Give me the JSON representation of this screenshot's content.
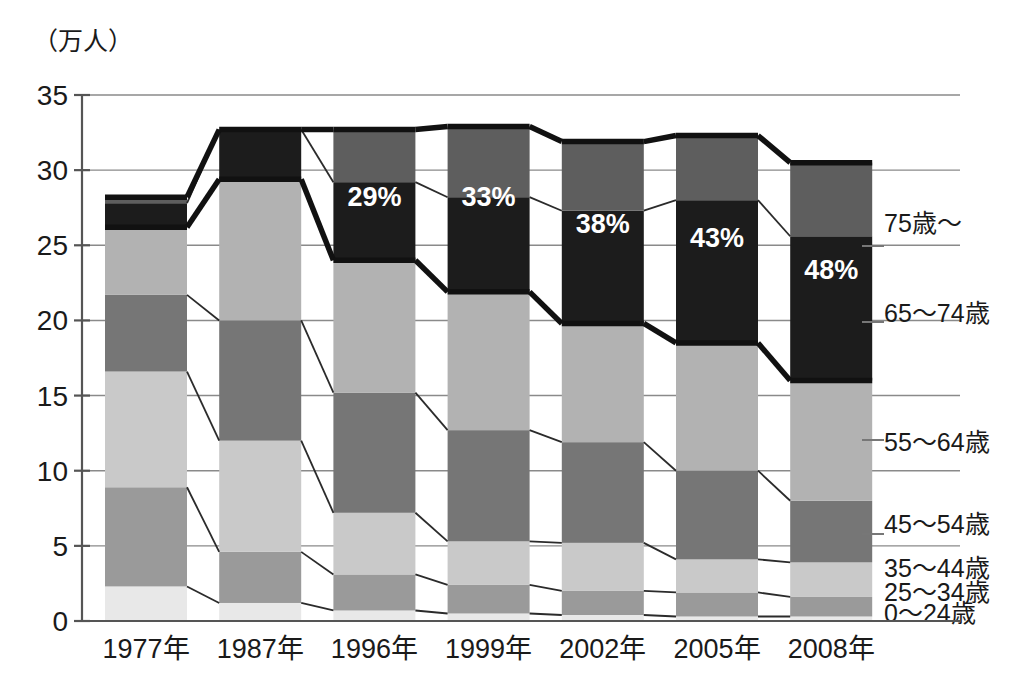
{
  "chart_data": {
    "type": "bar",
    "subtype": "stacked-bar-with-connectors",
    "title": "",
    "unit_label": "（万人）",
    "xlabel": "",
    "ylabel": "",
    "ylim": [
      0,
      35
    ],
    "yticks": [
      0,
      5,
      10,
      15,
      20,
      25,
      30,
      35
    ],
    "ytick_labels": [
      "0",
      "5",
      "10",
      "15",
      "20",
      "25",
      "30",
      "35"
    ],
    "grid": true,
    "legend_position": "right",
    "categories": [
      "1977年",
      "1987年",
      "1996年",
      "1999年",
      "2002年",
      "2005年",
      "2008年"
    ],
    "series": [
      {
        "name": "0～24歳",
        "values": [
          2.3,
          1.2,
          0.7,
          0.5,
          0.4,
          0.3,
          0.3
        ]
      },
      {
        "name": "25～34歳",
        "values": [
          6.6,
          3.4,
          2.4,
          1.9,
          1.6,
          1.6,
          1.3
        ]
      },
      {
        "name": "35～44歳",
        "values": [
          7.7,
          7.4,
          4.1,
          2.9,
          3.2,
          2.2,
          2.3
        ]
      },
      {
        "name": "45～54歳",
        "values": [
          5.1,
          8.0,
          8.0,
          7.4,
          6.7,
          5.9,
          4.1
        ]
      },
      {
        "name": "55～64歳",
        "values": [
          4.5,
          9.4,
          8.8,
          9.2,
          7.9,
          8.5,
          8.0
        ]
      },
      {
        "name": "65～74歳",
        "values": [
          1.6,
          3.3,
          5.2,
          6.3,
          7.5,
          9.5,
          9.6
        ]
      },
      {
        "name": "75歳～",
        "values": [
          0.4,
          0.0,
          3.5,
          4.7,
          4.6,
          4.3,
          4.9
        ]
      }
    ],
    "series_colors": [
      "#e8e8e8",
      "#9a9a9a",
      "#c9c9c9",
      "#767676",
      "#b2b2b2",
      "#1c1c1c",
      "#5e5e5e"
    ],
    "totals": [
      28.2,
      32.7,
      32.7,
      32.9,
      31.9,
      32.3,
      30.5
    ],
    "annotations": [
      {
        "category": "1996年",
        "text": "29%"
      },
      {
        "category": "1999年",
        "text": "33%"
      },
      {
        "category": "2002年",
        "text": "38%"
      },
      {
        "category": "2005年",
        "text": "43%"
      },
      {
        "category": "2008年",
        "text": "48%"
      }
    ],
    "legend_entries": [
      {
        "label": "75歳～"
      },
      {
        "label": "65～74歳"
      },
      {
        "label": "55～64歳"
      },
      {
        "label": "45～54歳"
      },
      {
        "label": "35～44歳"
      },
      {
        "label": "25～34歳"
      },
      {
        "label": "0～24歳"
      }
    ]
  }
}
